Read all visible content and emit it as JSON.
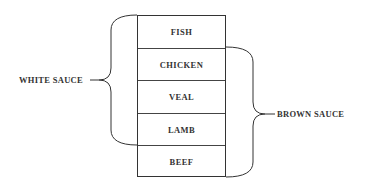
{
  "diagram": {
    "type": "grouping",
    "items": [
      {
        "label": "FISH"
      },
      {
        "label": "CHICKEN"
      },
      {
        "label": "VEAL"
      },
      {
        "label": "LAMB"
      },
      {
        "label": "BEEF"
      }
    ],
    "groups": {
      "white_sauce": {
        "label": "WHITE SAUCE",
        "members": [
          "FISH",
          "CHICKEN",
          "VEAL",
          "LAMB"
        ]
      },
      "brown_sauce": {
        "label": "BROWN SAUCE",
        "members": [
          "CHICKEN",
          "VEAL",
          "LAMB",
          "BEEF"
        ]
      }
    }
  }
}
